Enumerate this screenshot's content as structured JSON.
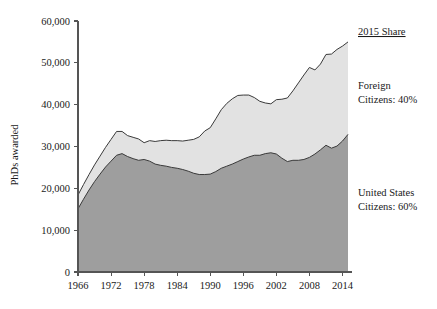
{
  "chart_data": {
    "type": "area",
    "stacked": true,
    "title": "",
    "xlabel": "",
    "ylabel": "PhDs awarded",
    "xlim": [
      1966,
      2015
    ],
    "ylim": [
      0,
      60000
    ],
    "grid": false,
    "legend_position": "right-outside",
    "xticks": [
      1966,
      1972,
      1978,
      1984,
      1990,
      1996,
      2002,
      2008,
      2014
    ],
    "xtick_labels": [
      "1966",
      "1972",
      "1978",
      "1984",
      "1990",
      "1996",
      "2002",
      "2008",
      "2014"
    ],
    "yticks": [
      0,
      10000,
      20000,
      30000,
      40000,
      50000,
      60000
    ],
    "ytick_labels": [
      "0",
      "10,000",
      "20,000",
      "30,000",
      "40,000",
      "50,000",
      "60,000"
    ],
    "x": [
      1966,
      1967,
      1968,
      1969,
      1970,
      1971,
      1972,
      1973,
      1974,
      1975,
      1976,
      1977,
      1978,
      1979,
      1980,
      1981,
      1982,
      1983,
      1984,
      1985,
      1986,
      1987,
      1988,
      1989,
      1990,
      1991,
      1992,
      1993,
      1994,
      1995,
      1996,
      1997,
      1998,
      1999,
      2000,
      2001,
      2002,
      2003,
      2004,
      2005,
      2006,
      2007,
      2008,
      2009,
      2010,
      2011,
      2012,
      2013,
      2014,
      2015
    ],
    "series": [
      {
        "name": "United States Citizens",
        "share_2015": "60%",
        "color": "#9e9e9e",
        "values": [
          15100,
          17400,
          19600,
          21600,
          23400,
          25100,
          26500,
          27900,
          28300,
          27600,
          27100,
          26700,
          26900,
          26500,
          25800,
          25500,
          25300,
          25000,
          24800,
          24500,
          24100,
          23600,
          23300,
          23300,
          23400,
          24000,
          24800,
          25300,
          25800,
          26400,
          27000,
          27500,
          27900,
          27900,
          28300,
          28500,
          28200,
          27200,
          26400,
          26700,
          26700,
          26900,
          27400,
          28200,
          29200,
          30300,
          29600,
          30100,
          31300,
          32900
        ]
      },
      {
        "name": "Foreign Citizens",
        "share_2015": "40%",
        "color": "#e2e2e2",
        "values": [
          3300,
          3500,
          3700,
          4000,
          4300,
          4700,
          5200,
          5700,
          5300,
          5000,
          5100,
          5100,
          4000,
          4900,
          5400,
          5900,
          6200,
          6400,
          6600,
          6800,
          7400,
          8100,
          9000,
          10400,
          11100,
          12600,
          14000,
          15000,
          15600,
          15800,
          15300,
          14800,
          13800,
          12900,
          12100,
          11700,
          13000,
          14100,
          15200,
          16600,
          18500,
          20200,
          21500,
          20100,
          20500,
          21700,
          22500,
          23100,
          22700,
          22100
        ]
      }
    ],
    "annotations": [
      {
        "id": "share-header",
        "text": "2015 Share",
        "underline": true
      },
      {
        "id": "foreign-label-line1",
        "text": "Foreign"
      },
      {
        "id": "foreign-label-line2",
        "text": "Citizens: 40%"
      },
      {
        "id": "us-label-line1",
        "text": "United States"
      },
      {
        "id": "us-label-line2",
        "text": "Citizens: 60%"
      }
    ],
    "colors": {
      "us_fill": "#9e9e9e",
      "foreign_fill": "#e2e2e2",
      "outline": "#3a3a3a",
      "axis": "#555555",
      "text": "#1a1a1a",
      "background": "#ffffff"
    }
  },
  "axis": {
    "y_label": "PhDs awarded"
  },
  "annotations": {
    "share_header": "2015 Share",
    "foreign_line1": "Foreign",
    "foreign_line2": "Citizens: 40%",
    "us_line1": "United States",
    "us_line2": "Citizens: 60%"
  }
}
